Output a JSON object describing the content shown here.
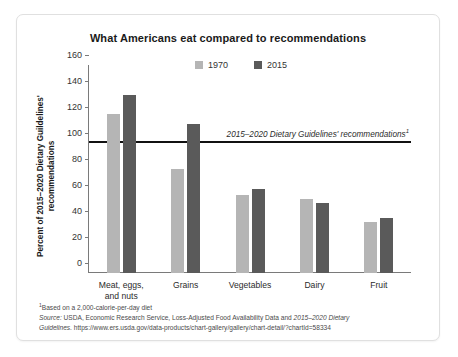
{
  "chart_data": {
    "type": "bar",
    "title": "What Americans eat compared to recommendations",
    "xlabel": "",
    "ylabel": "Percent of 2015–2020 Dietary Guildelines' recommendations",
    "categories": [
      "Meat, eggs, and nuts",
      "Grains",
      "Vegetables",
      "Dairy",
      "Fruit"
    ],
    "series": [
      {
        "name": "1970",
        "color": "#b5b5b5",
        "values": [
          122,
          80,
          60,
          57,
          39
        ]
      },
      {
        "name": "2015",
        "color": "#5a5a5a",
        "values": [
          137,
          115,
          65,
          54,
          42
        ]
      }
    ],
    "ylim": [
      0,
      160
    ],
    "yticks": [
      0,
      20,
      40,
      60,
      80,
      100,
      120,
      140,
      160
    ],
    "grid": false,
    "legend_position": "top-center",
    "reference_line": {
      "value": 100,
      "label": "2015–2020 Dietary Guidelines' recommendations",
      "footnote_marker": "1",
      "color": "#111111"
    },
    "annotations": [
      "¹ Based on a 2,000-calorie-per-day diet",
      "Source: USDA, Economic Research Service, Loss-Adjusted Food Availability Data and 2015–2020 Dietary Guidelines. https://www.ers.usda.gov/data-products/chart-gallery/gallery/chart-detail/?chartId=58334"
    ]
  },
  "notes": {
    "footnote_marker": "1",
    "footnote_text": "Based on a 2,000-calorie-per-day diet",
    "source_prefix": "Source:",
    "source_line1_a": " USDA, Economic Research Service, Loss-Adjusted Food Availability Data and ",
    "source_line1_italic": "2015–2020 Dietary",
    "source_line2_italic": "Guidelines.",
    "source_line2_b": " https://www.ers.usda.gov/data-products/chart-gallery/gallery/chart-detail/?chartId=58334"
  }
}
